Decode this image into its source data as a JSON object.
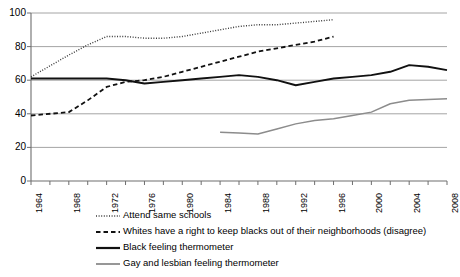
{
  "chart_data": {
    "type": "line",
    "title": "",
    "xlabel": "",
    "ylabel": "",
    "xlim": [
      1964,
      2008
    ],
    "ylim": [
      0,
      100
    ],
    "yticks": [
      0,
      20,
      40,
      60,
      80,
      100
    ],
    "xticks": [
      1964,
      1966,
      1968,
      1970,
      1972,
      1974,
      1976,
      1978,
      1980,
      1982,
      1984,
      1986,
      1988,
      1990,
      1992,
      1994,
      1996,
      1998,
      2000,
      2002,
      2004,
      2006,
      2008
    ],
    "xtick_labels_shown": [
      1964,
      1968,
      1972,
      1976,
      1980,
      1984,
      1988,
      1992,
      1996,
      2000,
      2004,
      2008
    ],
    "grid": "horizontal",
    "legend_position": "below",
    "series": [
      {
        "name": "Attend same schools",
        "style": "dotted",
        "color": "#3a3a3a",
        "x": [
          1964,
          1968,
          1970,
          1972,
          1974,
          1976,
          1978,
          1980,
          1982,
          1984,
          1986,
          1988,
          1990,
          1992,
          1994,
          1996
        ],
        "values": [
          62,
          75,
          81,
          86,
          86,
          85,
          85,
          86,
          88,
          90,
          92,
          93,
          93,
          94,
          95,
          96
        ]
      },
      {
        "name": "Whites have a right to keep blacks out of their neighborhoods (disagree)",
        "style": "dashed",
        "color": "#111111",
        "x": [
          1964,
          1968,
          1970,
          1972,
          1974,
          1976,
          1978,
          1980,
          1982,
          1984,
          1986,
          1988,
          1990,
          1992,
          1994,
          1996
        ],
        "values": [
          39,
          41,
          48,
          56,
          59,
          60,
          62,
          65,
          68,
          71,
          74,
          77,
          79,
          81,
          83,
          86
        ]
      },
      {
        "name": "Black feeling thermometer",
        "style": "solid",
        "color": "#111111",
        "x": [
          1964,
          1968,
          1970,
          1972,
          1974,
          1976,
          1978,
          1980,
          1982,
          1984,
          1986,
          1988,
          1990,
          1992,
          1994,
          1996,
          1998,
          2000,
          2002,
          2004,
          2006,
          2008
        ],
        "values": [
          61,
          61,
          61,
          61,
          60,
          58,
          59,
          60,
          61,
          62,
          63,
          62,
          60,
          57,
          59,
          61,
          62,
          63,
          65,
          69,
          68,
          66
        ]
      },
      {
        "name": "Gay and lesbian feeling thermometer",
        "style": "solid-gray",
        "color": "#8c8c8c",
        "x": [
          1984,
          1986,
          1988,
          1990,
          1992,
          1994,
          1996,
          1998,
          2000,
          2002,
          2004,
          2006,
          2008
        ],
        "values": [
          29,
          28.5,
          28,
          31,
          34,
          36,
          37,
          39,
          41,
          46,
          48,
          48.5,
          49
        ]
      }
    ]
  },
  "axis": {
    "ytick_labels": [
      "100",
      "80",
      "60",
      "40",
      "20",
      "0"
    ],
    "xtick_labels": [
      "1964",
      "1968",
      "1972",
      "1976",
      "1980",
      "1984",
      "1988",
      "1992",
      "1996",
      "2000",
      "2004",
      "2008"
    ]
  },
  "legend": {
    "items": [
      {
        "label": "Attend same schools",
        "icon": "dotted-line-swatch"
      },
      {
        "label": "Whites have a right to keep blacks out of their neighborhoods (disagree)",
        "icon": "dashed-line-swatch"
      },
      {
        "label": "Black feeling thermometer",
        "icon": "solid-black-line-swatch"
      },
      {
        "label": "Gay and lesbian feeling thermometer",
        "icon": "solid-gray-line-swatch"
      }
    ]
  }
}
